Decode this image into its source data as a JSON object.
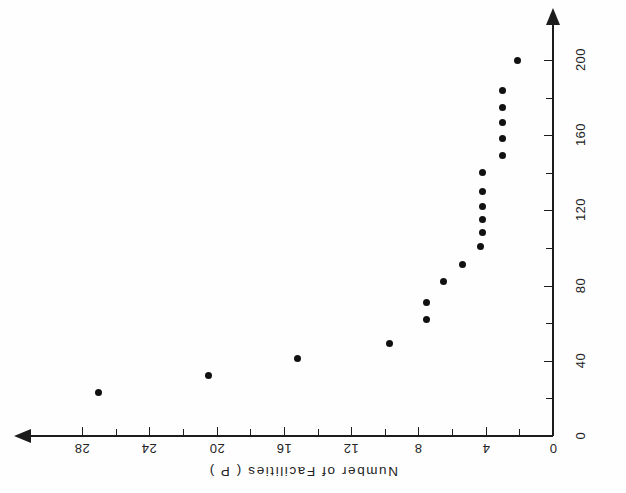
{
  "chart_data": {
    "type": "scatter",
    "title": "",
    "xlabel": "Number of Facilities ( P )",
    "ylabel": "Maximum Travel Distance ( Kms )",
    "x_tick_labels": [
      "0",
      "4",
      "8",
      "12",
      "16",
      "20",
      "24",
      "28"
    ],
    "x_ticks": [
      0,
      4,
      8,
      12,
      16,
      20,
      24,
      28
    ],
    "y_tick_labels": [
      "0",
      "40",
      "80",
      "120",
      "160",
      "200"
    ],
    "y_ticks": [
      0,
      40,
      80,
      120,
      160,
      200
    ],
    "xlim": [
      0,
      31
    ],
    "ylim": [
      0,
      220
    ],
    "x_axis_inverted": true,
    "x_axis_position": "bottom",
    "y_axis_position": "right",
    "grid": false,
    "legend": false,
    "minor_ticks": true,
    "x_minor_interval": 2,
    "y_minor_interval": 20,
    "marker": "filled-circle",
    "marker_color": "#111111",
    "axis_color": "#1c1c1c",
    "background_color": "#fefefe",
    "x": [
      27,
      20.5,
      15.2,
      9.7,
      7.5,
      7.5,
      6.5,
      5.4,
      4.3,
      4.2,
      4.2,
      4.2,
      4.2,
      4.2,
      3.0,
      3.0,
      3.0,
      3.0,
      3.0,
      2.1
    ],
    "y": [
      23,
      32,
      41,
      49,
      62,
      71,
      82,
      91,
      101,
      108,
      115,
      122,
      130,
      140,
      149,
      158,
      167,
      175,
      184,
      200
    ],
    "points": [
      {
        "facilities": 27,
        "distance": 23
      },
      {
        "facilities": 20.5,
        "distance": 32
      },
      {
        "facilities": 15.2,
        "distance": 41
      },
      {
        "facilities": 9.7,
        "distance": 49
      },
      {
        "facilities": 7.5,
        "distance": 62
      },
      {
        "facilities": 7.5,
        "distance": 71
      },
      {
        "facilities": 6.5,
        "distance": 82
      },
      {
        "facilities": 5.4,
        "distance": 91
      },
      {
        "facilities": 4.3,
        "distance": 101
      },
      {
        "facilities": 4.2,
        "distance": 108
      },
      {
        "facilities": 4.2,
        "distance": 115
      },
      {
        "facilities": 4.2,
        "distance": 122
      },
      {
        "facilities": 4.2,
        "distance": 130
      },
      {
        "facilities": 4.2,
        "distance": 140
      },
      {
        "facilities": 3.0,
        "distance": 149
      },
      {
        "facilities": 3.0,
        "distance": 158
      },
      {
        "facilities": 3.0,
        "distance": 167
      },
      {
        "facilities": 3.0,
        "distance": 175
      },
      {
        "facilities": 3.0,
        "distance": 184
      },
      {
        "facilities": 2.1,
        "distance": 200
      }
    ]
  }
}
